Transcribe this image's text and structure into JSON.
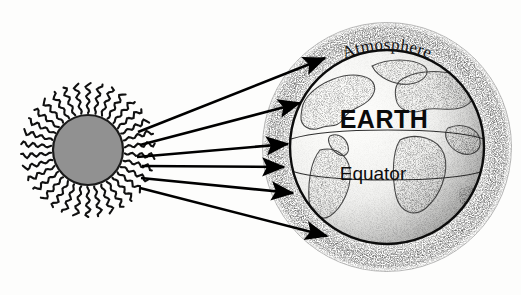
{
  "diagram": {
    "background_color": "#fdfdfc",
    "labels": {
      "atmosphere": "Atmosphere",
      "earth": "EARTH",
      "equator": "Equator"
    },
    "sun": {
      "name": "Sun",
      "fill_color": "#919191",
      "outline_color": "#1a1a1a",
      "center_x": 88,
      "center_y": 150,
      "radius": 35,
      "ray_count": 34,
      "ray_style": "wavy",
      "ray_length": 30
    },
    "earth": {
      "name": "Earth",
      "center_x": 387,
      "center_y": 147,
      "globe_radius": 97,
      "atmosphere_outer_radius": 125,
      "outline_color": "#101010",
      "stipple_color": "#2b2b2b",
      "equator_band_top_offset": -8,
      "equator_band_bottom_offset": 24
    },
    "rays": {
      "name": "Sunlight rays",
      "count": 6,
      "color": "#000000",
      "line_width": 2.6,
      "arrows": [
        {
          "id": 1,
          "x1": 138,
          "y1": 132,
          "x2": 325,
          "y2": 58
        },
        {
          "id": 2,
          "x1": 140,
          "y1": 145,
          "x2": 300,
          "y2": 103
        },
        {
          "id": 3,
          "x1": 137,
          "y1": 157,
          "x2": 288,
          "y2": 144
        },
        {
          "id": 4,
          "x1": 142,
          "y1": 166,
          "x2": 284,
          "y2": 167
        },
        {
          "id": 5,
          "x1": 141,
          "y1": 178,
          "x2": 293,
          "y2": 193
        },
        {
          "id": 6,
          "x1": 140,
          "y1": 188,
          "x2": 327,
          "y2": 236
        }
      ]
    }
  }
}
